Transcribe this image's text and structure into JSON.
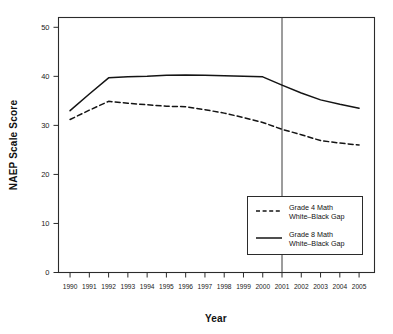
{
  "chart_data": {
    "type": "line",
    "title": "",
    "xlabel": "Year",
    "ylabel": "NAEP Scale Score",
    "x": [
      1990,
      1991,
      1992,
      1993,
      1994,
      1995,
      1996,
      1997,
      1998,
      1999,
      2000,
      2001,
      2002,
      2003,
      2004,
      2005
    ],
    "xlim": [
      1989.4,
      2005.8
    ],
    "ylim": [
      0,
      52
    ],
    "yticks": [
      0,
      10,
      20,
      30,
      40,
      50
    ],
    "xticks": [
      "1990",
      "1991",
      "1992",
      "1993",
      "1994",
      "1995",
      "1996",
      "1997",
      "1998",
      "1999",
      "2000",
      "2001",
      "2002",
      "2003",
      "2004",
      "2005"
    ],
    "grid": false,
    "legend_position": "inside-lower-right",
    "series": [
      {
        "name": "Grade 4 Math\nWhite–Black Gap",
        "label_line1": "Grade 4 Math",
        "label_line2": "White–Black Gap",
        "style": "dashed",
        "color": "#141414",
        "values": [
          31.2,
          33.1,
          34.9,
          34.5,
          34.2,
          33.9,
          33.8,
          33.2,
          32.5,
          31.6,
          30.6,
          29.2,
          28.1,
          26.9,
          26.4,
          26.0
        ]
      },
      {
        "name": "Grade 8 Math\nWhite–Black Gap",
        "label_line1": "Grade 8 Math",
        "label_line2": "White–Black Gap",
        "style": "solid",
        "color": "#141414",
        "values": [
          33.0,
          36.4,
          39.7,
          39.9,
          40.0,
          40.2,
          40.3,
          40.2,
          40.1,
          40.0,
          39.9,
          38.2,
          36.6,
          35.2,
          34.3,
          33.5
        ]
      }
    ],
    "annotations": [
      {
        "type": "vertical-reference-line",
        "name": "year-2001-reference-line",
        "x": 2001,
        "color": "#3a3a3a"
      }
    ]
  },
  "legend": {
    "entries": [
      {
        "label_line1": "Grade 4 Math",
        "label_line2": "White–Black Gap",
        "style": "dashed"
      },
      {
        "label_line1": "Grade 8 Math",
        "label_line2": "White–Black Gap",
        "style": "solid"
      }
    ]
  },
  "axes": {
    "x_title": "Year",
    "y_title": "NAEP Scale Score"
  }
}
